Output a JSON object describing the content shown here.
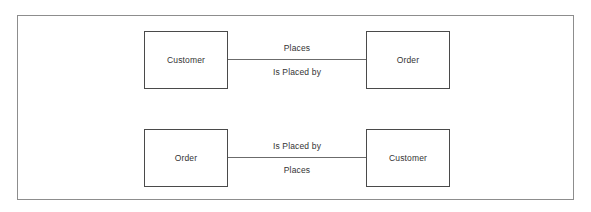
{
  "diagram": {
    "type": "entity-relationship",
    "frame": {
      "border_color": "#8d8d8d",
      "background": "#ffffff"
    },
    "entity_border_color": "#4a4a4a",
    "connector_color": "#6b6b6b",
    "text_color": "#333333",
    "rows": [
      {
        "left_entity": "Customer",
        "right_entity": "Order",
        "label_above": "Places",
        "label_below": "Is Placed by"
      },
      {
        "left_entity": "Order",
        "right_entity": "Customer",
        "label_above": "Is Placed by",
        "label_below": "Places"
      }
    ]
  }
}
